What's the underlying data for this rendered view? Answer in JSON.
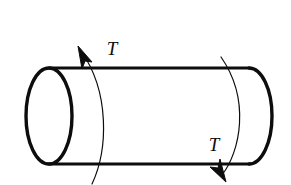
{
  "figure": {
    "name": "shaft-under-torsion",
    "background_color": "#ffffff",
    "stroke_color": "#0d0d0d",
    "canvas": {
      "width": 291,
      "height": 185
    }
  },
  "shaft": {
    "name": "cylindrical-shaft",
    "left_end_cx": 49,
    "left_end_cy": 116,
    "left_end_rx": 23,
    "left_end_ry": 48,
    "right_end_cx": 249,
    "right_end_cy": 116,
    "right_end_rx": 23,
    "right_end_ry": 48,
    "top_edge_y": 68,
    "bottom_edge_y": 164,
    "body_stroke_width": 3.2
  },
  "torque_arrows": [
    {
      "id": "left-torque-arrow",
      "label": "T",
      "label_x": 112,
      "label_y": 55,
      "arc_path": "M 92,184 C 108,150 110,92 80,50",
      "arrow_tip_x": 80,
      "arrow_tip_y": 48,
      "direction": "up-left",
      "stroke_width": 1.2
    },
    {
      "id": "right-torque-arrow",
      "label": "T",
      "label_x": 214,
      "label_y": 151,
      "arc_path": "M 221,57 C 251,100 240,152 223,176",
      "arrow_tip_x": 224,
      "arrow_tip_y": 180,
      "direction": "down-right",
      "stroke_width": 1.2
    }
  ]
}
